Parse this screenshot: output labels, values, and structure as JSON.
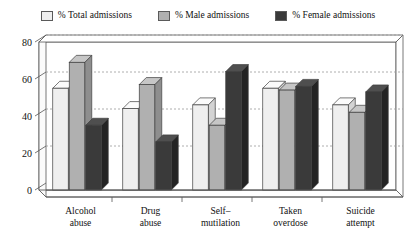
{
  "chart_data": {
    "type": "bar",
    "title": "",
    "subtitle": "",
    "xlabel": "",
    "ylabel": "",
    "ylim": [
      0,
      80
    ],
    "yticks": [
      0,
      20,
      40,
      60,
      80
    ],
    "grid": true,
    "grid_axis": "y",
    "legend_position": "top",
    "style": "3d-bars",
    "categories": [
      "Alcohol abuse",
      "Drug abuse",
      "Self–mutilation",
      "Taken overdose",
      "Suicide attempt"
    ],
    "category_lines": [
      [
        "Alcohol",
        "abuse"
      ],
      [
        "Drug",
        "abuse"
      ],
      [
        "Self–",
        "mutilation"
      ],
      [
        "Taken",
        "overdose"
      ],
      [
        "Suicide",
        "attempt"
      ]
    ],
    "series": [
      {
        "name": "% Total admissions",
        "color": "#efefef",
        "values": [
          55,
          44,
          46,
          55,
          46
        ]
      },
      {
        "name": "% Male admissions",
        "color": "#b0b0b0",
        "values": [
          69,
          57,
          35,
          54,
          42
        ]
      },
      {
        "name": "% Female admissions",
        "color": "#3a3a3a",
        "values": [
          35,
          26,
          64,
          56,
          53
        ]
      }
    ]
  },
  "legend": {
    "items": [
      {
        "label": "% Total admissions",
        "color": "#efefef"
      },
      {
        "label": "% Male admissions",
        "color": "#b0b0b0"
      },
      {
        "label": "% Female admissions",
        "color": "#3a3a3a"
      }
    ]
  },
  "axis": {
    "y_tick_labels": [
      "80",
      "60",
      "40",
      "20",
      "0"
    ]
  }
}
